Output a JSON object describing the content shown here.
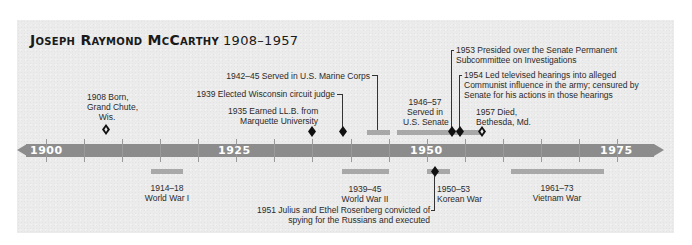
{
  "title": {
    "name": "Joseph Raymond McCarthy",
    "years": "1908–1957"
  },
  "axis": {
    "start_year": 1900,
    "end_year": 1975,
    "labels": [
      "1900",
      "1925",
      "1950",
      "1975"
    ],
    "tick_interval_years": 5,
    "color": "#8c8c8c"
  },
  "colors": {
    "panel": "#ebebeb",
    "bar": "#a8a8a8",
    "marker": "#111111",
    "text": "#2a2a2a"
  },
  "events_above": [
    {
      "id": "born",
      "year": "1908",
      "text_lines": [
        "1908 Born,",
        "Grand Chute,",
        "Wis."
      ],
      "marker": "open-diamond"
    },
    {
      "id": "llb",
      "year": "1935",
      "text_lines": [
        "1935 Earned LL.B. from",
        "Marquette University"
      ],
      "marker": "diamond"
    },
    {
      "id": "judge",
      "year": "1939",
      "text_lines": [
        "1939 Elected Wisconsin circuit judge"
      ],
      "marker": "diamond"
    },
    {
      "id": "marines",
      "years": "1942–45",
      "text_lines": [
        "1942–45 Served in U.S. Marine Corps"
      ],
      "marker": "bar"
    },
    {
      "id": "senate",
      "years": "1946–57",
      "text_lines": [
        "1946–57",
        "Served in",
        "U.S. Senate"
      ],
      "marker": "bar"
    },
    {
      "id": "subcommittee",
      "year": "1953",
      "text_lines": [
        "1953 Presided over the Senate Permanent",
        "Subcommittee on Investigations"
      ],
      "marker": "diamond"
    },
    {
      "id": "hearings",
      "year": "1954",
      "text_lines": [
        "1954 Led televised hearings into alleged",
        "Communist influence in the army; censured by",
        "Senate for his actions in those hearings"
      ],
      "marker": "diamond"
    },
    {
      "id": "died",
      "year": "1957",
      "text_lines": [
        "1957 Died,",
        "Bethesda, Md."
      ],
      "marker": "open-diamond"
    }
  ],
  "events_below": [
    {
      "id": "ww1",
      "years": "1914–18",
      "text_lines": [
        "1914–18",
        "World War I"
      ],
      "marker": "bar"
    },
    {
      "id": "ww2",
      "years": "1939–45",
      "text_lines": [
        "1939–45",
        "World War II"
      ],
      "marker": "bar"
    },
    {
      "id": "korea",
      "years": "1950–53",
      "text_lines": [
        "1950–53",
        "Korean War"
      ],
      "marker": "bar"
    },
    {
      "id": "rosenberg",
      "year": "1951",
      "text_lines": [
        "1951 Julius and Ethel Rosenberg convicted of",
        "spying for the Russians and executed"
      ],
      "marker": "diamond"
    },
    {
      "id": "vietnam",
      "years": "1961–73",
      "text_lines": [
        "1961–73",
        "Vietnam War"
      ],
      "marker": "bar"
    }
  ]
}
